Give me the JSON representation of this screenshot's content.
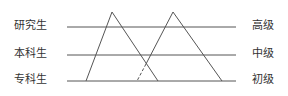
{
  "diagram": {
    "left_labels": [
      "研究生",
      "本科生",
      "专科生"
    ],
    "right_labels": [
      "高级",
      "中级",
      "初级"
    ],
    "levels": [
      {
        "left": "研究生",
        "right": "高级",
        "y": 27
      },
      {
        "left": "本科生",
        "right": "中级",
        "y": 55
      },
      {
        "left": "专科生",
        "right": "初级",
        "y": 81
      }
    ],
    "triangles": [
      {
        "name": "education-triangle",
        "apex": [
          112,
          12
        ],
        "base_left": [
          86,
          81
        ],
        "base_right": [
          158,
          81
        ]
      },
      {
        "name": "title-triangle",
        "apex": [
          173,
          12
        ],
        "base_left": [
          137,
          81
        ],
        "base_right": [
          222,
          81
        ],
        "dashed_segment": [
          [
            146,
            64
          ],
          [
            137,
            81
          ]
        ]
      }
    ],
    "line_color": "#555555"
  }
}
